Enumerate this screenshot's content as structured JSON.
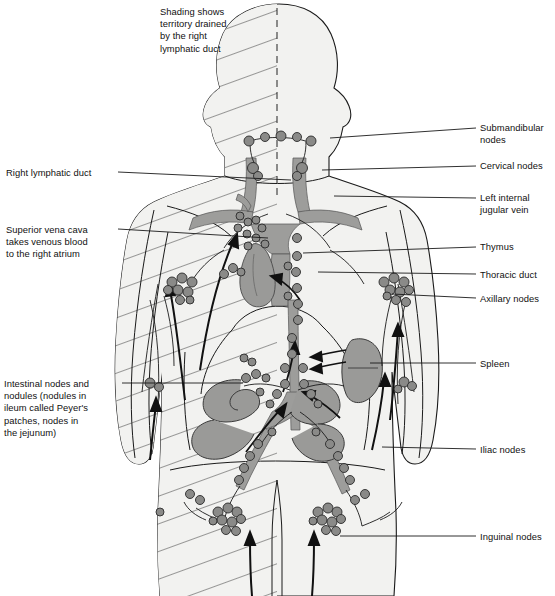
{
  "figure": {
    "type": "anatomical-diagram",
    "legend_note": "Shading shows\nterritory drained\nby the right\nlymphatic duct",
    "colors": {
      "background": "#ffffff",
      "body_fill": "#f2f2f0",
      "outline": "#1a1a1a",
      "vessel_gray": "#9d9d9b",
      "organ_gray": "#9a9a98",
      "node_gray": "#8a8a88",
      "node_outline": "#2a2a2a",
      "hatch_line": "#3a3a3a",
      "leader_line": "#1a1a1a"
    },
    "midline_style": "dashed"
  },
  "labels_left": [
    {
      "id": "right-lymphatic-duct",
      "text": "Right lymphatic duct",
      "x": 6,
      "y": 167,
      "leader": {
        "x1": 118,
        "y1": 172,
        "x2": 291,
        "y2": 180
      }
    },
    {
      "id": "superior-vena-cava",
      "text": "Superior vena cava\ntakes venous blood\nto the right atrium",
      "x": 6,
      "y": 224,
      "leader": {
        "x1": 118,
        "y1": 229,
        "x2": 268,
        "y2": 238
      }
    },
    {
      "id": "intestinal-nodes",
      "text": "Intestinal nodes and\nnodules (nodules in\nileum called Peyer's\npatches, nodes in\nthe jejunum)",
      "x": 4,
      "y": 378,
      "leader": {
        "x1": 122,
        "y1": 383,
        "x2": 243,
        "y2": 383
      }
    }
  ],
  "labels_right": [
    {
      "id": "submandibular-nodes",
      "text": "Submandibular\nnodes",
      "x": 480,
      "y": 122,
      "leader": {
        "x1": 476,
        "y1": 128,
        "x2": 330,
        "y2": 138
      }
    },
    {
      "id": "cervical-nodes",
      "text": "Cervical nodes",
      "x": 480,
      "y": 160,
      "leader": {
        "x1": 476,
        "y1": 166,
        "x2": 322,
        "y2": 170
      }
    },
    {
      "id": "left-internal-jugular-vein",
      "text": "Left internal\njugular vein",
      "x": 480,
      "y": 192,
      "leader": {
        "x1": 476,
        "y1": 198,
        "x2": 334,
        "y2": 196
      }
    },
    {
      "id": "thymus",
      "text": "Thymus",
      "x": 480,
      "y": 241,
      "leader": {
        "x1": 476,
        "y1": 247,
        "x2": 303,
        "y2": 253
      }
    },
    {
      "id": "thoracic-duct",
      "text": "Thoracic duct",
      "x": 480,
      "y": 269,
      "leader": {
        "x1": 476,
        "y1": 274,
        "x2": 318,
        "y2": 272
      }
    },
    {
      "id": "axillary-nodes",
      "text": "Axillary nodes",
      "x": 480,
      "y": 293,
      "leader": {
        "x1": 476,
        "y1": 298,
        "x2": 392,
        "y2": 294
      }
    },
    {
      "id": "spleen",
      "text": "Spleen",
      "x": 480,
      "y": 358,
      "leader": {
        "x1": 476,
        "y1": 363,
        "x2": 370,
        "y2": 363
      }
    },
    {
      "id": "iliac-nodes",
      "text": "Iliac nodes",
      "x": 480,
      "y": 444,
      "leader": {
        "x1": 476,
        "y1": 449,
        "x2": 382,
        "y2": 447
      }
    },
    {
      "id": "inguinal-nodes",
      "text": "Inguinal nodes",
      "x": 480,
      "y": 531,
      "leader": {
        "x1": 476,
        "y1": 536,
        "x2": 340,
        "y2": 536
      }
    }
  ],
  "legend_box": {
    "x": 160,
    "y": 6
  },
  "structures": [
    "head",
    "neck",
    "torso",
    "left-arm",
    "right-arm",
    "left-leg",
    "right-leg",
    "thymus",
    "spleen",
    "intestines",
    "thoracic-duct",
    "right-lymphatic-duct",
    "cisterna-chyli",
    "jugular-veins",
    "subclavian-veins"
  ],
  "node_groups": [
    {
      "name": "submandibular",
      "count": 5
    },
    {
      "name": "cervical",
      "count": 4
    },
    {
      "name": "axillary-right",
      "count": 9
    },
    {
      "name": "axillary-left",
      "count": 8
    },
    {
      "name": "cubital-right",
      "count": 3
    },
    {
      "name": "cubital-left",
      "count": 2
    },
    {
      "name": "thoracic-chain",
      "count": 12
    },
    {
      "name": "mesenteric",
      "count": 14
    },
    {
      "name": "iliac",
      "count": 10
    },
    {
      "name": "inguinal-right",
      "count": 12
    },
    {
      "name": "inguinal-left",
      "count": 11
    }
  ]
}
